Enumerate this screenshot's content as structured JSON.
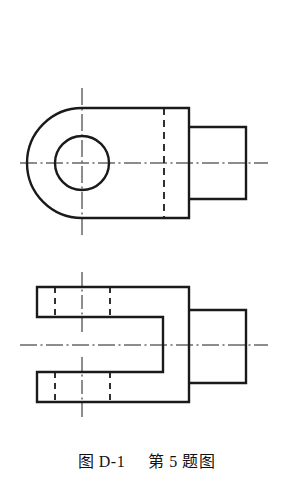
{
  "figure": {
    "caption_label": "图 D-1",
    "caption_title": "第 5 题图",
    "line_color": "#1a1a1a",
    "background_color": "#ffffff",
    "views": [
      {
        "name": "front-view",
        "description": "圆头板加阶梯轴 正面视图",
        "features": [
          "rounded-left-end",
          "through-hole-circle",
          "hidden-line-vertical",
          "stepped-shaft-right",
          "horizontal-centerline",
          "vertical-centerline"
        ]
      },
      {
        "name": "top-view",
        "description": "U 形叉口 俯视图",
        "features": [
          "upper-prong",
          "lower-prong",
          "u-slot",
          "hidden-hole-edges",
          "stepped-shaft-right",
          "horizontal-centerline",
          "prong-centerlines"
        ]
      }
    ],
    "geometry": {
      "front_view": {
        "body_left_x": 37,
        "body_right_x": 189,
        "body_top_y": 108,
        "body_bottom_y": 218,
        "arc_center_x": 82,
        "arc_center_y": 163,
        "arc_radius": 55,
        "hole_center_x": 82,
        "hole_center_y": 163,
        "hole_radius": 27,
        "hidden_line_x": 164,
        "shaft_left_x": 189,
        "shaft_right_x": 246,
        "shaft_top_y": 127,
        "shaft_bottom_y": 199,
        "centerline_y": 163,
        "centerline_x1": 20,
        "centerline_x2": 268,
        "vcenterline_x": 82,
        "vcenterline_y1": 88,
        "vcenterline_y2": 238
      },
      "top_view": {
        "outer_left_x": 37,
        "body_right_x": 189,
        "outer_top_y": 287,
        "outer_bottom_y": 402,
        "upper_prong_bottom_y": 317,
        "lower_prong_top_y": 372,
        "slot_back_x": 163,
        "hidden_x1": 55,
        "hidden_x2": 110,
        "shaft_left_x": 189,
        "shaft_right_x": 246,
        "shaft_top_y": 310,
        "shaft_bottom_y": 383,
        "centerline_y": 345,
        "centerline_x1": 20,
        "centerline_x2": 268,
        "prong_centerline_x": 82
      }
    }
  }
}
